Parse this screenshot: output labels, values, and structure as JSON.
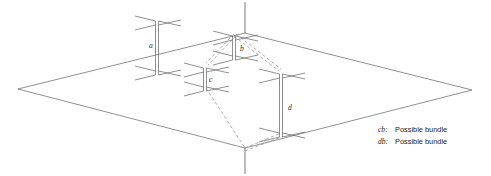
{
  "figure": {
    "title": "",
    "stroke_color": "#6b6b6b",
    "dashed_color": "#8a8a8a",
    "label_color": "#2b2b2b",
    "beam_labels": [
      {
        "id": "a",
        "text": "a",
        "x": 149,
        "y": 48
      },
      {
        "id": "b",
        "text": "b",
        "x": 241,
        "y": 51
      },
      {
        "id": "c",
        "text": "c",
        "x": 210,
        "y": 82
      },
      {
        "id": "d",
        "text": "d",
        "x": 288,
        "y": 110
      }
    ],
    "ground_plane": {
      "left_vertex": "18,89",
      "top_vertex": "245,33",
      "right_vertex": "472,90",
      "bottom_vertex": "245,148"
    },
    "vertical_axes": [
      {
        "name": "top-axis",
        "from": "245,33",
        "to": "245,2"
      },
      {
        "name": "bottom-axis",
        "from": "245,148",
        "to": "245,174"
      }
    ]
  },
  "legend": {
    "rows": [
      {
        "key": "cb:",
        "label": "Possible bundle"
      },
      {
        "key": "db:",
        "label": "Possible bundle"
      }
    ]
  }
}
